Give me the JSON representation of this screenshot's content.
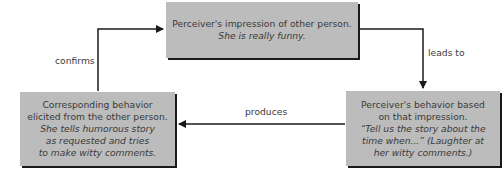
{
  "diagram": {
    "type": "cycle",
    "colors": {
      "box_fill": "#bcbcbc",
      "box_shadow": "#1a1a1a",
      "arrow": "#1a1a1a",
      "text": "#3a3a3a"
    },
    "nodes": [
      {
        "id": "impression",
        "lines": [
          "Perceiver's impression of other person."
        ],
        "italic_lines": [
          "She is really funny."
        ]
      },
      {
        "id": "perceiver_behavior",
        "lines": [
          "Perceiver's behavior based",
          "on that impression."
        ],
        "italic_lines": [
          "“Tell us the story about the",
          "time when...” (Laughter at",
          "her witty comments.)"
        ]
      },
      {
        "id": "corresponding_behavior",
        "lines": [
          "Corresponding behavior",
          "elicited from the other person."
        ],
        "italic_lines": [
          "She tells humorous story",
          "as requested and tries",
          "to make witty comments."
        ]
      }
    ],
    "edges": [
      {
        "from": "impression",
        "to": "perceiver_behavior",
        "label": "leads to"
      },
      {
        "from": "perceiver_behavior",
        "to": "corresponding_behavior",
        "label": "produces"
      },
      {
        "from": "corresponding_behavior",
        "to": "impression",
        "label": "confirms"
      }
    ]
  }
}
